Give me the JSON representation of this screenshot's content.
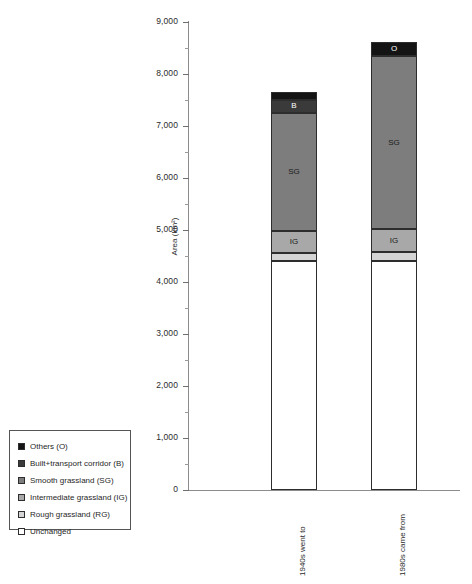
{
  "chart_data": {
    "type": "bar",
    "title": "",
    "subtitle": "",
    "xlabel": "",
    "ylabel": "Area (km²)",
    "ylim": [
      0,
      9000
    ],
    "ytick_labels": [
      "9,000",
      "8,000",
      "7,000",
      "6,000",
      "5,000",
      "4,000",
      "3,000",
      "2,000",
      "1,000",
      "0"
    ],
    "ytick_values": [
      9000,
      8000,
      7000,
      6000,
      5000,
      4000,
      3000,
      2000,
      1000,
      0
    ],
    "grid": false,
    "legend_position": "bottom-left",
    "stacked": true,
    "categories": [
      "1940s went to",
      "1980s came from"
    ],
    "series": [
      {
        "name": "Unchanged",
        "code": "",
        "color": "#ffffff",
        "values": [
          4400,
          4400
        ]
      },
      {
        "name": "Rough grassland (RG)",
        "code": "RG",
        "color": "#d4d4d4",
        "values": [
          150,
          170
        ]
      },
      {
        "name": "Intermediate grassland (IG)",
        "code": "IG",
        "color": "#a8a8a8",
        "values": [
          430,
          440
        ]
      },
      {
        "name": "Smooth grassland (SG)",
        "code": "SG",
        "color": "#7d7d7d",
        "values": [
          2270,
          3320
        ]
      },
      {
        "name": "Built+transport corridor (B)",
        "code": "B",
        "color": "#3a3a3a",
        "values": [
          250,
          0
        ]
      },
      {
        "name": "Others (O)",
        "code": "O",
        "color": "#141414",
        "values": [
          150,
          270
        ]
      }
    ],
    "totals": [
      7650,
      8600
    ],
    "segment_labels": {
      "bar1": [
        "RG",
        "IG",
        "SG",
        "B",
        "O"
      ],
      "bar2": [
        "RG",
        "IG",
        "SG",
        "O"
      ]
    }
  },
  "legend": {
    "items": [
      {
        "label": "Others (O)",
        "color": "#141414"
      },
      {
        "label": "Built+transport corridor (B)",
        "color": "#3a3a3a"
      },
      {
        "label": "Smooth grassland (SG)",
        "color": "#7d7d7d"
      },
      {
        "label": "Intermediate grassland (IG)",
        "color": "#a8a8a8"
      },
      {
        "label": "Rough grassland (RG)",
        "color": "#d4d4d4"
      },
      {
        "label": "Unchanged",
        "color": "#ffffff"
      }
    ]
  },
  "axes": {
    "y_title": "Area (km²)",
    "y_ticks": [
      "9,000",
      "8,000",
      "7,000",
      "6,000",
      "5,000",
      "4,000",
      "3,000",
      "2,000",
      "1,000",
      "0"
    ],
    "x_ticks": [
      "1940s went to",
      "1980s came from"
    ]
  }
}
